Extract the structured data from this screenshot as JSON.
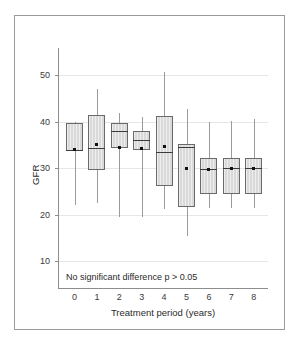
{
  "chart_data": {
    "type": "box",
    "title": "",
    "xlabel": "Treatment period (years)",
    "ylabel": "GFR",
    "annotation": "No significant difference p > 0.05",
    "grid": true,
    "legend": "none",
    "xlim": [
      -0.6,
      8.6
    ],
    "ylim": [
      5,
      57
    ],
    "categories": [
      "0",
      "1",
      "2",
      "3",
      "4",
      "5",
      "6",
      "7",
      "8"
    ],
    "ytick_labels": [
      "50",
      "40",
      "30",
      "20",
      "10"
    ],
    "ytick_values": [
      50,
      40,
      30,
      20,
      10
    ],
    "xtick_labels": [
      "0",
      "1",
      "2",
      "3",
      "4",
      "5",
      "6",
      "7",
      "8"
    ],
    "boxes": [
      {
        "category": "0",
        "whisker_low": 22.0,
        "q1": 33.6,
        "median": 33.9,
        "q3": 39.6,
        "whisker_high": 39.9,
        "mean": 33.9
      },
      {
        "category": "1",
        "whisker_low": 22.5,
        "q1": 29.6,
        "median": 34.3,
        "q3": 41.4,
        "whisker_high": 47.0,
        "mean": 35.0
      },
      {
        "category": "2",
        "whisker_low": 19.4,
        "q1": 34.3,
        "median": 38.0,
        "q3": 39.6,
        "whisker_high": 41.9,
        "mean": 34.5
      },
      {
        "category": "3",
        "whisker_low": 19.5,
        "q1": 33.8,
        "median": 36.1,
        "q3": 37.9,
        "whisker_high": 41.0,
        "mean": 34.1
      },
      {
        "category": "4",
        "whisker_low": 21.2,
        "q1": 26.2,
        "median": 33.5,
        "q3": 41.1,
        "whisker_high": 50.7,
        "mean": 34.6
      },
      {
        "category": "5",
        "whisker_low": 15.3,
        "q1": 21.7,
        "median": 34.6,
        "q3": 35.1,
        "whisker_high": 42.6,
        "mean": 29.9
      },
      {
        "category": "6",
        "whisker_low": 21.3,
        "q1": 24.4,
        "median": 29.7,
        "q3": 32.2,
        "whisker_high": 40.0,
        "mean": 29.6
      },
      {
        "category": "7",
        "whisker_low": 21.4,
        "q1": 24.4,
        "median": 30.0,
        "q3": 32.2,
        "whisker_high": 40.2,
        "mean": 29.8
      },
      {
        "category": "8",
        "whisker_low": 21.4,
        "q1": 24.4,
        "median": 29.9,
        "q3": 32.2,
        "whisker_high": 40.5,
        "mean": 29.8
      }
    ]
  },
  "style": {
    "box_fill": "#d9d9d9",
    "box_border": "#6a6a6a",
    "whisker_color": "#9b9b9b",
    "grid_color": "#e6e6e6",
    "axis_color": "#8d8d8d",
    "text_color": "#2b2b2b",
    "frame_color": "#9a9a9a",
    "background": "#ffffff"
  }
}
